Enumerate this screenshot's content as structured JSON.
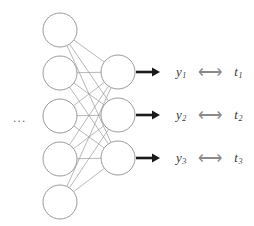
{
  "diagram": {
    "ellipsis": "...",
    "colors": {
      "node_stroke": "#8f8f8f",
      "node_fill": "#ffffff",
      "edge": "#9a9a9a",
      "output_arrow": "#1a1a1a",
      "compare_arrow": "#8a8a8a",
      "label_text": "#3a3a3a"
    },
    "hidden_layer": {
      "name": "hidden-layer",
      "count": 5,
      "radius": 17,
      "cx": 60,
      "nodes": [
        {
          "id": "hidden-node-1",
          "cy": 30
        },
        {
          "id": "hidden-node-2",
          "cy": 73
        },
        {
          "id": "hidden-node-3",
          "cy": 116
        },
        {
          "id": "hidden-node-4",
          "cy": 159
        },
        {
          "id": "hidden-node-5",
          "cy": 202
        }
      ]
    },
    "output_layer": {
      "name": "output-layer",
      "count": 3,
      "radius": 17,
      "cx": 118,
      "nodes": [
        {
          "id": "output-node-1",
          "cy": 72
        },
        {
          "id": "output-node-2",
          "cy": 115
        },
        {
          "id": "output-node-3",
          "cy": 158
        }
      ]
    },
    "output_arrows": [
      {
        "id": "output-arrow-1",
        "x1": 136,
        "x2": 160,
        "y": 72
      },
      {
        "id": "output-arrow-2",
        "x1": 136,
        "x2": 160,
        "y": 115
      },
      {
        "id": "output-arrow-3",
        "x1": 136,
        "x2": 160,
        "y": 158
      }
    ],
    "comparisons": [
      {
        "id": "comparison-1",
        "top": 60,
        "left": 176,
        "output_base": "y",
        "output_sub": "1",
        "relation": "⟷",
        "target_base": "t",
        "target_sub": "1"
      },
      {
        "id": "comparison-2",
        "top": 103,
        "left": 176,
        "output_base": "y",
        "output_sub": "2",
        "relation": "⟷",
        "target_base": "t",
        "target_sub": "2"
      },
      {
        "id": "comparison-3",
        "top": 146,
        "left": 176,
        "output_base": "y",
        "output_sub": "3",
        "relation": "⟷",
        "target_base": "t",
        "target_sub": "3"
      }
    ]
  }
}
